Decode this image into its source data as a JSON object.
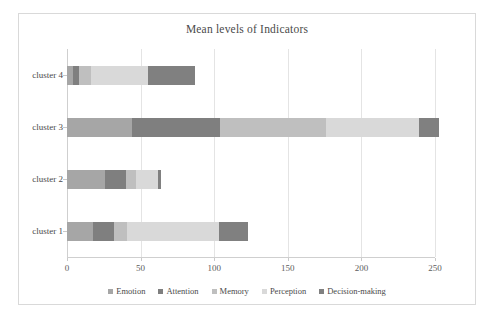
{
  "chart_data": {
    "type": "bar",
    "orientation": "horizontal",
    "stacked": true,
    "title": "Mean levels of Indicators",
    "xlabel": "",
    "ylabel": "",
    "categories": [
      "cluster 1",
      "cluster 2",
      "cluster 3",
      "cluster 4"
    ],
    "series": [
      {
        "name": "Emotion",
        "color": "#a6a6a6",
        "values": [
          18,
          26,
          44,
          4
        ]
      },
      {
        "name": "Attention",
        "color": "#7f7f7f",
        "values": [
          14,
          14,
          60,
          4
        ]
      },
      {
        "name": "Memory",
        "color": "#bfbfbf",
        "values": [
          9,
          7,
          72,
          8
        ]
      },
      {
        "name": "Perception",
        "color": "#d9d9d9",
        "values": [
          62,
          15,
          63,
          39
        ]
      },
      {
        "name": "Decision-making",
        "color": "#808080",
        "values": [
          20,
          2,
          14,
          32
        ]
      }
    ],
    "totals": [
      123,
      64,
      253,
      87
    ],
    "xlim": [
      0,
      250
    ],
    "xticks": [
      0,
      50,
      100,
      150,
      200,
      250
    ],
    "xtick_labels": [
      "0",
      "50",
      "100",
      "150",
      "200",
      "250"
    ],
    "grid": true,
    "legend_position": "bottom",
    "legend_entries": [
      "Emotion",
      "Attention",
      "Memory",
      "Perception",
      "Decision-making"
    ]
  }
}
